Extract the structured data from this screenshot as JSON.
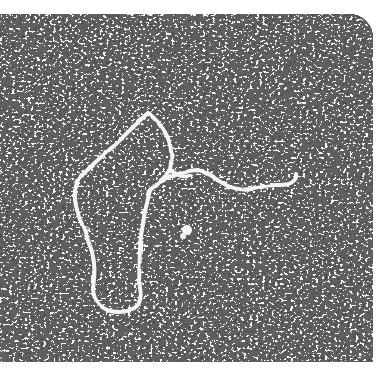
{
  "caption": {
    "text": "",
    "note": "clipped line of text at top edge; only descender pixels visible"
  },
  "micrograph": {
    "subject": "nucleic acid strand with loop structure",
    "style": "grayscale electron micrograph, high-contrast grainy background",
    "colors": {
      "background_dark": "#111111",
      "grain_light": "#f2f2f2",
      "strand": "#f5f5f5"
    },
    "features": [
      {
        "name": "upper-loop",
        "description": "closed loop at top-center of strand"
      },
      {
        "name": "lower-loop",
        "description": "elongated U-shaped lower segment"
      },
      {
        "name": "tail",
        "description": "wavy free strand extending to the right"
      },
      {
        "name": "bright-particle",
        "description": "small bright blob near center"
      }
    ]
  }
}
